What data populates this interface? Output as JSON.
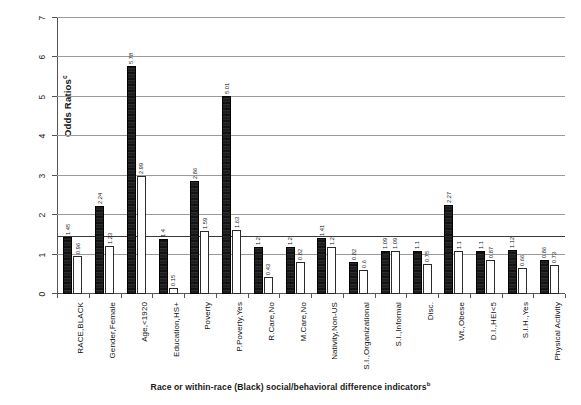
{
  "chart_data": {
    "type": "bar",
    "title": "",
    "subtitle": "",
    "xlabel": "Race or within-race (Black) social/behavioral difference indicators",
    "xlabel_superscript": "b",
    "ylabel": "Odds Ratios",
    "ylabel_superscript": "c",
    "ylim": [
      0,
      7
    ],
    "yticks": [
      0,
      1,
      2,
      3,
      4,
      5,
      6,
      7
    ],
    "ytick_labels": [
      "0",
      "1",
      "2",
      "3",
      "4",
      "5",
      "6",
      "7"
    ],
    "grid": true,
    "gridlines_at": [
      1,
      2,
      3,
      4,
      5,
      6,
      7
    ],
    "reference_line": 1.45,
    "legend": "none",
    "legend_position": "none",
    "categories": [
      "RACE,BLACK",
      "Gender,Female",
      "Age,<1920",
      "Education,HS+",
      "Poverty",
      "P.Poverty,Yes",
      "R.Care,No",
      "M.Care,No",
      "Nativity,Non-US",
      "S.I.,Organizational",
      "S.I.,Informal",
      "Disc.",
      "Wt.,Obese",
      "D.I.,HEI<5",
      "S.I.H.,Yes",
      "Physical Activity"
    ],
    "series": [
      {
        "name": "Unadjusted",
        "style": "dark",
        "values": [
          1.45,
          2.24,
          5.78,
          1.4,
          2.86,
          5.01,
          1.2,
          1.2,
          1.41,
          0.82,
          1.09,
          1.1,
          2.27,
          1.1,
          1.12,
          0.86
        ]
      },
      {
        "name": "Adjusted",
        "style": "light",
        "values": [
          0.96,
          1.23,
          2.99,
          0.15,
          1.59,
          1.63,
          0.43,
          0.82,
          1.2,
          0.6,
          1.09,
          0.75,
          1.1,
          0.87,
          0.66,
          0.73
        ]
      }
    ],
    "bar_value_labels": [
      [
        "1.45",
        "0.96"
      ],
      [
        "2.24",
        "1.23"
      ],
      [
        "5.78",
        "2.99"
      ],
      [
        "1.4",
        "0.15"
      ],
      [
        "2.86",
        "1.59"
      ],
      [
        "5.01",
        "1.63"
      ],
      [
        "1.2",
        "0.43"
      ],
      [
        "1.2",
        "0.82"
      ],
      [
        "1.41",
        "1.2"
      ],
      [
        "0.82",
        "0.6"
      ],
      [
        "1.09",
        "1.09"
      ],
      [
        "1.1",
        "0.75"
      ],
      [
        "2.27",
        "1.1"
      ],
      [
        "1.1",
        "0.87"
      ],
      [
        "1.12",
        "0.66"
      ],
      [
        "0.86",
        "0.73"
      ]
    ]
  }
}
